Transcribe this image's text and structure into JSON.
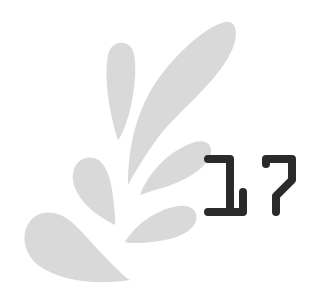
{
  "graphic": {
    "number": "17",
    "digits": [
      "1",
      "7"
    ],
    "colors": {
      "petal": "#d9d9d9",
      "digit": "#2a2a2a",
      "background": "#ffffff"
    },
    "icon": "flower-petal-splash-icon"
  }
}
